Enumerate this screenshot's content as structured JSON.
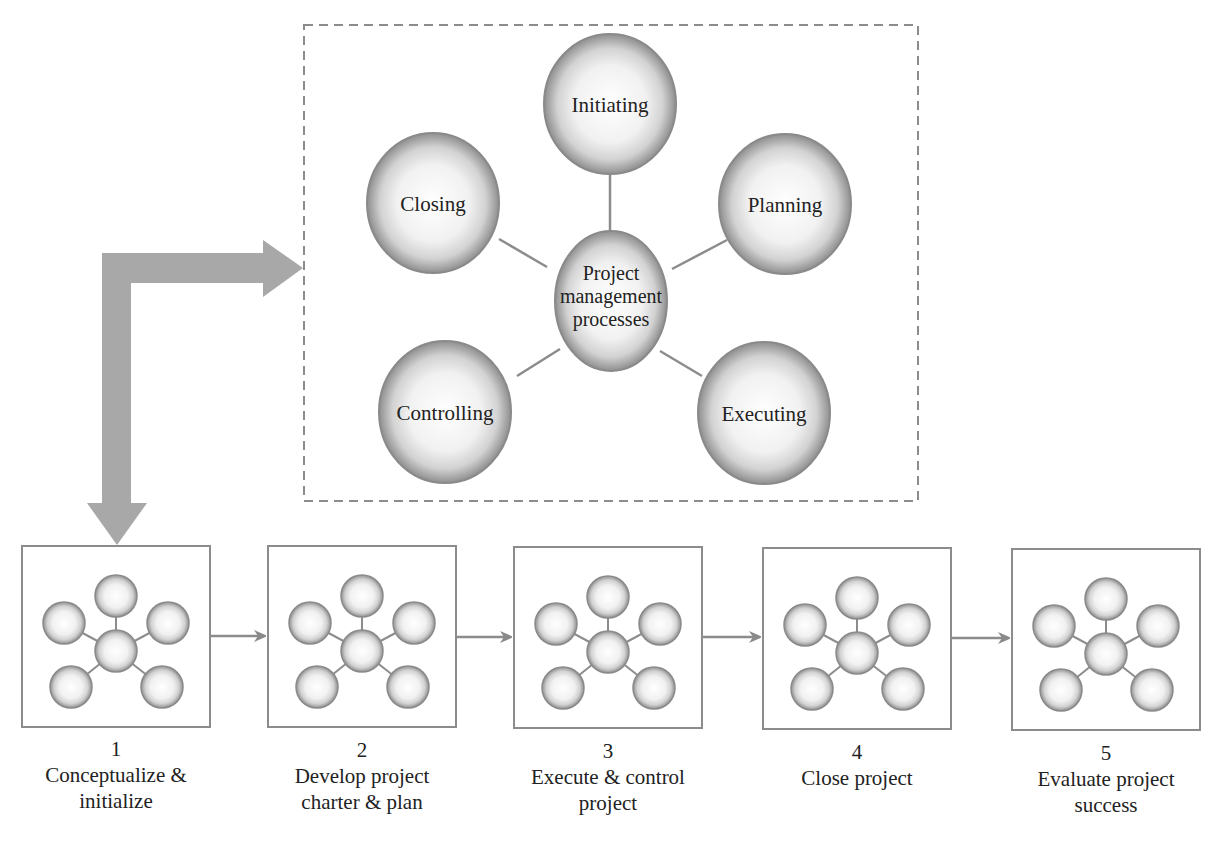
{
  "diagram": {
    "type": "project-management-lifecycle",
    "hub": {
      "label_lines": [
        "Project",
        "management",
        "processes"
      ]
    },
    "processes": [
      {
        "id": "initiating",
        "label": "Initiating"
      },
      {
        "id": "planning",
        "label": "Planning"
      },
      {
        "id": "executing",
        "label": "Executing"
      },
      {
        "id": "controlling",
        "label": "Controlling"
      },
      {
        "id": "closing",
        "label": "Closing"
      }
    ],
    "steps": [
      {
        "number": "1",
        "lines": [
          "Conceptualize &",
          "initialize"
        ]
      },
      {
        "number": "2",
        "lines": [
          "Develop project",
          "charter & plan"
        ]
      },
      {
        "number": "3",
        "lines": [
          "Execute & control",
          "project"
        ]
      },
      {
        "number": "4",
        "lines": [
          "Close project"
        ]
      },
      {
        "number": "5",
        "lines": [
          "Evaluate project",
          "success"
        ]
      }
    ],
    "colors": {
      "sphere_edge": "#8a8a8a",
      "sphere_light": "#ffffff",
      "line": "#8c8c8c",
      "arrow": "#a6a6a6",
      "box_border": "#8c8c8c",
      "dashed_border": "#8c8c8c"
    }
  }
}
